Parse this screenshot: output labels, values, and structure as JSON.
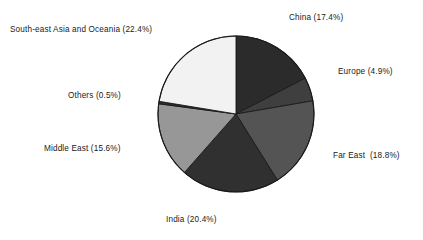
{
  "chart_data": {
    "type": "pie",
    "title": "",
    "xlabel": "",
    "ylabel": "",
    "legend_position": "none",
    "grid": false,
    "labels_inline": true,
    "start_angle_deg": 0,
    "direction": "clockwise",
    "categories": [
      "China",
      "Europe",
      "Far East",
      "India",
      "Middle East",
      "Others",
      "South-east Asia and Oceania"
    ],
    "values": [
      17.4,
      4.9,
      18.8,
      20.4,
      15.6,
      0.5,
      22.4
    ],
    "value_unit": "%",
    "slices": [
      {
        "name": "China",
        "value": 17.4,
        "label": "China (17.4%)",
        "color": "#2b2b2b"
      },
      {
        "name": "Europe",
        "value": 4.9,
        "label": "Europe (4.9%)",
        "color": "#3f3f3f"
      },
      {
        "name": "Far East",
        "value": 18.8,
        "label": "Far East  (18.8%)",
        "color": "#545454"
      },
      {
        "name": "India",
        "value": 20.4,
        "label": "India (20.4%)",
        "color": "#303030"
      },
      {
        "name": "Middle East",
        "value": 15.6,
        "label": "Middle East (15.6%)",
        "color": "#979797"
      },
      {
        "name": "Others",
        "value": 0.5,
        "label": "Others (0.5%)",
        "color": "#2e2e2e"
      },
      {
        "name": "South-east Asia and Oceania",
        "value": 22.4,
        "label": "South-east Asia and Oceania (22.4%)",
        "color": "#f2f2f2"
      }
    ]
  },
  "colors": {
    "background": "#ffffff",
    "text": "#1a1a1a",
    "outline": "#1a1a1a"
  }
}
